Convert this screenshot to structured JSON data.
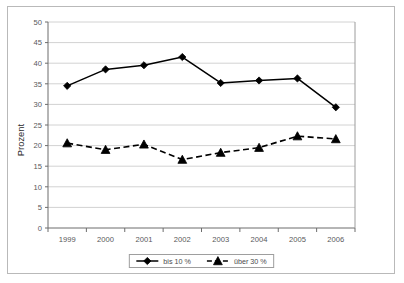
{
  "chart_data": {
    "type": "line",
    "title": "",
    "xlabel": "",
    "ylabel": "Prozent",
    "categories": [
      "1999",
      "2000",
      "2001",
      "2002",
      "2003",
      "2004",
      "2005",
      "2006"
    ],
    "ylim": [
      0,
      50
    ],
    "ytick_step": 5,
    "yticks": [
      "0",
      "5",
      "10",
      "15",
      "20",
      "25",
      "30",
      "35",
      "40",
      "45",
      "50"
    ],
    "grid": "horizontal",
    "legend_position": "bottom-center",
    "series": [
      {
        "name": "bis 10 %",
        "marker": "diamond",
        "line_style": "solid",
        "color": "#000000",
        "values": [
          34.5,
          38.5,
          39.5,
          41.5,
          35.2,
          35.8,
          36.3,
          29.3
        ]
      },
      {
        "name": "über 30 %",
        "marker": "triangle",
        "line_style": "dashed",
        "color": "#000000",
        "values": [
          20.6,
          19.0,
          20.3,
          16.6,
          18.3,
          19.5,
          22.3,
          21.6
        ]
      }
    ]
  },
  "axis": {
    "y_title": "Prozent"
  },
  "legend": {
    "entries": [
      {
        "label": "bis 10 %"
      },
      {
        "label": "über 30 %"
      }
    ]
  },
  "colors": {
    "frame": "#b9b9b9",
    "grid": "#d2d2d2",
    "axis": "#6d6d6d",
    "series": "#000000",
    "background": "#ffffff"
  }
}
